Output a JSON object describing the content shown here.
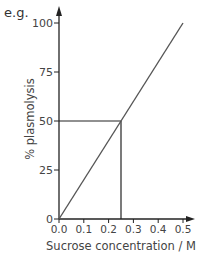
{
  "prefix": "e.g.",
  "chart_data": {
    "type": "line",
    "title": "",
    "xlabel": "Sucrose concentration / M",
    "ylabel": "% plasmolysis",
    "xlim": [
      0,
      0.5
    ],
    "ylim": [
      0,
      100
    ],
    "x_ticks": [
      "0.0",
      "0.1",
      "0.2",
      "0.3",
      "0.4",
      "0.5"
    ],
    "x_tick_values": [
      0,
      0.1,
      0.2,
      0.3,
      0.4,
      0.5
    ],
    "y_ticks": [
      "0",
      "25",
      "50",
      "75",
      "100"
    ],
    "y_tick_values": [
      0,
      25,
      50,
      75,
      100
    ],
    "grid": false,
    "series": [
      {
        "name": "plasmolysis",
        "x": [
          0,
          0.5
        ],
        "y": [
          0,
          100
        ]
      }
    ],
    "annotations": [
      {
        "type": "guide",
        "description": "horizontal line from y-axis at 50 to curve, vertical line down to x = 0.25",
        "x": 0.25,
        "y": 50
      }
    ]
  },
  "colors": {
    "axis": "#222222",
    "line": "#555555",
    "text": "#444444"
  }
}
